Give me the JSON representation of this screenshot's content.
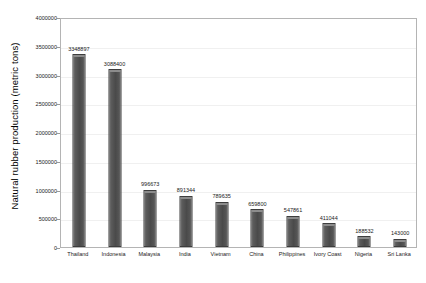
{
  "chart_data": {
    "type": "bar",
    "title": "",
    "subtitle": "",
    "xlabel": "",
    "ylabel": "Natural rubber production (metric tons)",
    "categories": [
      "Thailand",
      "Indonesia",
      "Malaysia",
      "India",
      "Vietnam",
      "China",
      "Philippines",
      "Ivory Coast",
      "Nigeria",
      "Sri Lanka"
    ],
    "values": [
      3348897,
      3088400,
      996673,
      891344,
      789635,
      659800,
      547861,
      411044,
      188532,
      143000
    ],
    "data_labels": [
      "3348897",
      "3088400",
      "996673",
      "891344",
      "789635",
      "659800",
      "547861",
      "411044",
      "188532",
      "143000"
    ],
    "ylim": [
      0,
      4000000
    ],
    "ytick_values": [
      0,
      500000,
      1000000,
      1500000,
      2000000,
      2500000,
      3000000,
      3500000,
      4000000
    ],
    "ytick_labels": [
      "0",
      "500000",
      "1000000",
      "1500000",
      "2000000",
      "2500000",
      "3000000",
      "3500000",
      "4000000"
    ],
    "grid": true,
    "grid_axis": "y",
    "legend": false,
    "legend_position": "none",
    "series": [
      {
        "name": "Natural rubber production",
        "color": "#4a4a4a",
        "values": [
          3348897,
          3088400,
          996673,
          891344,
          789635,
          659800,
          547861,
          411044,
          188532,
          143000
        ]
      }
    ]
  },
  "colors": {
    "bar_fill": "#4a4a4a",
    "bar_edge": "#3d3d3d",
    "bar_highlight": "#8c8c8c",
    "plot_border": "#b4b4b4",
    "gridline": "#f0f0f0",
    "text": "#1a1a1a",
    "background": "#ffffff"
  }
}
